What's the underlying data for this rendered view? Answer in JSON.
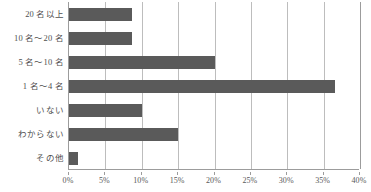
{
  "chart_data": {
    "type": "bar",
    "orientation": "horizontal",
    "title": "",
    "xlabel": "",
    "ylabel": "",
    "categories": [
      "20 名以上",
      "10 名〜20 名",
      "5 名〜10 名",
      "1 名〜4 名",
      "いない",
      "わからない",
      "その他"
    ],
    "values": [
      8.6,
      8.6,
      20.0,
      36.5,
      10.0,
      15.0,
      1.2
    ],
    "xlim": [
      0,
      40
    ],
    "xtick_values": [
      0,
      5,
      10,
      15,
      20,
      25,
      30,
      35,
      40
    ],
    "xtick_labels": [
      "0%",
      "5%",
      "10%",
      "15%",
      "20%",
      "25%",
      "30%",
      "35%",
      "40%"
    ],
    "grid": "vertical",
    "legend": "none",
    "bar_color": "#5a5a5a",
    "gridline_color": "#bdbdbd",
    "axis_color": "#9c9c9c",
    "text_color": "#4f4f4f"
  }
}
